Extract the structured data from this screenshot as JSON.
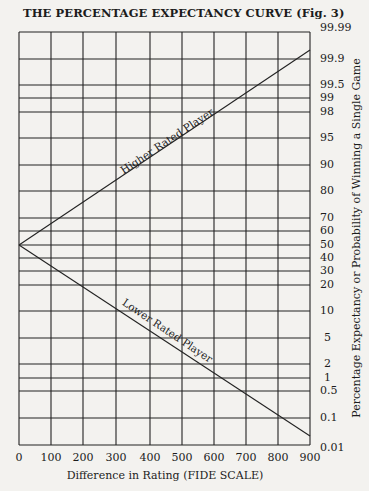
{
  "chart_data": {
    "type": "line",
    "title": "THE PERCENTAGE EXPECTANCY CURVE (Fig. 3)",
    "xlabel": "Difference in Rating (FIDE SCALE)",
    "ylabel": "Percentage Expectancy or Probability of Winning a Single Game",
    "x_ticks": [
      "0",
      "100",
      "200",
      "300",
      "400",
      "500",
      "600",
      "700",
      "800",
      "900"
    ],
    "y_ticks": [
      "99.99",
      "99.9",
      "99.5",
      "99",
      "98",
      "95",
      "90",
      "80",
      "70",
      "60",
      "50",
      "40",
      "30",
      "20",
      "10",
      "5",
      "2",
      "1",
      "0.5",
      "0.1",
      "0.01"
    ],
    "xlim": [
      0,
      900
    ],
    "ylim": [
      0.01,
      99.99
    ],
    "y_scale": "probability (normal)",
    "grid": true,
    "x": [
      0,
      100,
      200,
      300,
      400,
      500,
      600,
      700,
      800,
      900
    ],
    "series": [
      {
        "name": "Higher Rated Player",
        "values": [
          50,
          64,
          76,
          85,
          92,
          96,
          98.5,
          99.4,
          99.8,
          99.95
        ]
      },
      {
        "name": "Lower Rated Player",
        "values": [
          50,
          36,
          24,
          15,
          8,
          4,
          1.5,
          0.6,
          0.2,
          0.05
        ]
      }
    ],
    "annotations": [
      "Higher Rated Player",
      "Lower Rated Player"
    ]
  }
}
